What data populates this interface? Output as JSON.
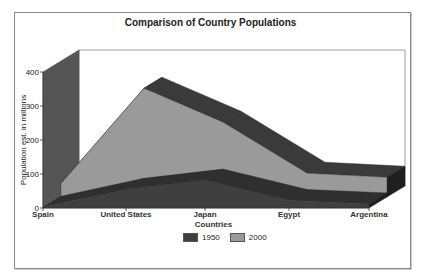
{
  "chart_data": {
    "type": "area",
    "subtype": "3d-area",
    "title": "Comparison of Country Populations",
    "xlabel": "Countries",
    "ylabel": "Population est. in millions",
    "categories": [
      "Spain",
      "United States",
      "Japan",
      "Egypt",
      "Argentina"
    ],
    "series": [
      {
        "name": "1950",
        "values": [
          2,
          55,
          82,
          22,
          12
        ],
        "color": "#3f3f3f"
      },
      {
        "name": "2000",
        "values": [
          40,
          320,
          220,
          70,
          58
        ],
        "color": "#9a9a9a"
      }
    ],
    "yticks": [
      "0",
      "100",
      "200",
      "300",
      "400"
    ],
    "ylim": [
      0,
      400
    ],
    "grid": false,
    "legend_position": "bottom"
  },
  "legend": {
    "items": [
      {
        "label": "1950",
        "color": "#3f3f3f"
      },
      {
        "label": "2000",
        "color": "#9a9a9a"
      }
    ]
  }
}
